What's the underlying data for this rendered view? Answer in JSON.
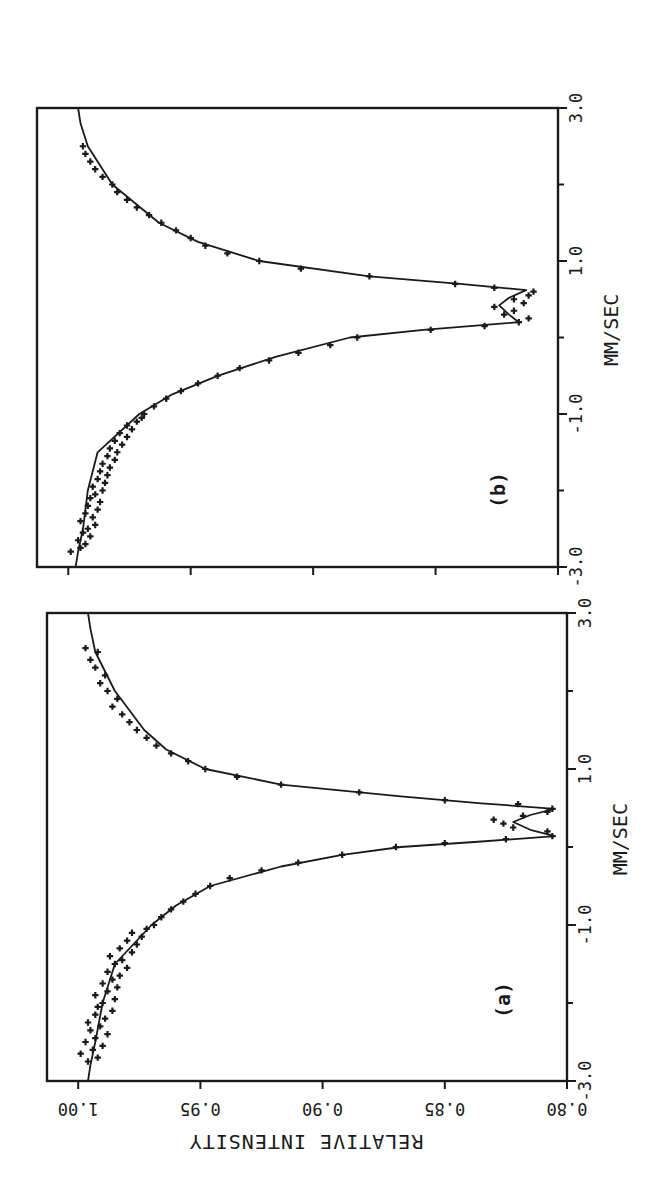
{
  "figure": {
    "background": "#ffffff",
    "ink_color": "#1a1a1a",
    "orientation": "rotated 90 degrees clockwise",
    "shared_ylabel": "RELATIVE INTENSITY"
  },
  "chart_data": [
    {
      "panel": "(a)",
      "type": "scatter",
      "title": "(a)",
      "xlabel": "MM/SEC",
      "ylabel": "RELATIVE INTENSITY",
      "xlim": [
        -3.0,
        3.0
      ],
      "ylim": [
        0.8,
        1.0
      ],
      "x_ticks": [
        -3.0,
        -2.0,
        -1.0,
        0.0,
        1.0,
        2.0,
        3.0
      ],
      "x_tick_labels": [
        "-3.0",
        "",
        "-1.0",
        "",
        "1.0",
        "",
        "3.0"
      ],
      "y_ticks": [
        0.8,
        0.85,
        0.9,
        0.95,
        1.0
      ],
      "y_tick_labels": [
        "0.80",
        "0.85",
        "0.90",
        "0.95",
        "1.00"
      ],
      "grid": false,
      "legend": null,
      "annotations": [
        "quadrupole doublet, minima near 0.14 and 0.49 mm/s"
      ],
      "series": [
        {
          "name": "fit",
          "style": "line",
          "x": [
            -3.0,
            -2.8,
            -2.5,
            -2.0,
            -1.5,
            -1.0,
            -0.75,
            -0.5,
            -0.25,
            -0.1,
            0.0,
            0.07,
            0.14,
            0.22,
            0.32,
            0.41,
            0.49,
            0.56,
            0.65,
            0.8,
            1.0,
            1.25,
            1.5,
            2.0,
            2.5,
            2.8,
            3.0
          ],
          "y": [
            0.996,
            0.995,
            0.993,
            0.99,
            0.985,
            0.97,
            0.96,
            0.946,
            0.917,
            0.892,
            0.868,
            0.835,
            0.805,
            0.815,
            0.822,
            0.815,
            0.805,
            0.835,
            0.868,
            0.917,
            0.948,
            0.964,
            0.973,
            0.985,
            0.993,
            0.995,
            0.996
          ]
        },
        {
          "name": "data",
          "style": "plus-markers",
          "x": [
            -2.75,
            -2.7,
            -2.65,
            -2.6,
            -2.55,
            -2.5,
            -2.45,
            -2.4,
            -2.35,
            -2.3,
            -2.25,
            -2.2,
            -2.15,
            -2.1,
            -2.05,
            -2.0,
            -1.95,
            -1.9,
            -1.85,
            -1.8,
            -1.75,
            -1.7,
            -1.65,
            -1.6,
            -1.55,
            -1.5,
            -1.45,
            -1.4,
            -1.35,
            -1.3,
            -1.25,
            -1.2,
            -1.15,
            -1.1,
            -1.05,
            -1.0,
            -0.9,
            -0.8,
            -0.7,
            -0.6,
            -0.5,
            -0.4,
            -0.3,
            -0.2,
            -0.1,
            0.0,
            0.05,
            0.1,
            0.14,
            0.2,
            0.25,
            0.3,
            0.35,
            0.4,
            0.45,
            0.49,
            0.55,
            0.6,
            0.7,
            0.8,
            0.9,
            1.0,
            1.1,
            1.2,
            1.3,
            1.4,
            1.5,
            1.6,
            1.7,
            1.8,
            1.9,
            2.0,
            2.1,
            2.2,
            2.3,
            2.4,
            2.5,
            2.55
          ],
          "y": [
            0.996,
            0.992,
            0.999,
            0.994,
            0.99,
            0.997,
            0.993,
            0.988,
            0.995,
            0.991,
            0.996,
            0.989,
            0.993,
            0.986,
            0.992,
            0.99,
            0.985,
            0.993,
            0.988,
            0.984,
            0.99,
            0.986,
            0.983,
            0.988,
            0.98,
            0.985,
            0.982,
            0.987,
            0.978,
            0.983,
            0.976,
            0.98,
            0.974,
            0.978,
            0.972,
            0.969,
            0.966,
            0.962,
            0.957,
            0.952,
            0.946,
            0.938,
            0.925,
            0.91,
            0.892,
            0.87,
            0.85,
            0.825,
            0.806,
            0.808,
            0.822,
            0.826,
            0.83,
            0.818,
            0.808,
            0.806,
            0.82,
            0.85,
            0.885,
            0.917,
            0.935,
            0.948,
            0.955,
            0.962,
            0.968,
            0.972,
            0.976,
            0.979,
            0.982,
            0.986,
            0.984,
            0.988,
            0.991,
            0.989,
            0.993,
            0.995,
            0.992,
            0.997
          ]
        }
      ]
    },
    {
      "panel": "(b)",
      "type": "scatter",
      "title": "(b)",
      "xlabel": "MM/SEC",
      "ylabel": "RELATIVE INTENSITY",
      "xlim": [
        -3.0,
        3.0
      ],
      "ylim": [
        0.8,
        1.0
      ],
      "x_ticks": [
        -3.0,
        -2.0,
        -1.0,
        0.0,
        1.0,
        2.0,
        3.0
      ],
      "x_tick_labels": [
        "-3.0",
        "",
        "-1.0",
        "",
        "1.0",
        "",
        "3.0"
      ],
      "y_ticks": [
        0.8,
        0.85,
        0.9,
        0.95,
        1.0
      ],
      "y_tick_labels": [
        "",
        "",
        "",
        "",
        ""
      ],
      "grid": false,
      "legend": null,
      "annotations": [
        "broadened doublet, minima near 0.2 and 0.62 mm/s"
      ],
      "series": [
        {
          "name": "fit",
          "style": "line",
          "x": [
            -3.0,
            -2.8,
            -2.5,
            -2.0,
            -1.5,
            -1.0,
            -0.75,
            -0.5,
            -0.25,
            0.0,
            0.1,
            0.2,
            0.3,
            0.42,
            0.52,
            0.62,
            0.7,
            0.8,
            1.0,
            1.25,
            1.5,
            2.0,
            2.5,
            2.8,
            3.0
          ],
          "y": [
            0.997,
            0.996,
            0.994,
            0.992,
            0.988,
            0.971,
            0.958,
            0.939,
            0.915,
            0.885,
            0.855,
            0.816,
            0.82,
            0.824,
            0.82,
            0.813,
            0.84,
            0.877,
            0.922,
            0.947,
            0.963,
            0.982,
            0.992,
            0.995,
            0.996
          ]
        },
        {
          "name": "data",
          "style": "plus-markers",
          "x": [
            -2.8,
            -2.75,
            -2.7,
            -2.65,
            -2.6,
            -2.55,
            -2.5,
            -2.45,
            -2.4,
            -2.35,
            -2.3,
            -2.25,
            -2.2,
            -2.15,
            -2.1,
            -2.05,
            -2.0,
            -1.95,
            -1.9,
            -1.85,
            -1.8,
            -1.75,
            -1.7,
            -1.65,
            -1.6,
            -1.55,
            -1.5,
            -1.45,
            -1.4,
            -1.35,
            -1.3,
            -1.25,
            -1.2,
            -1.15,
            -1.1,
            -1.05,
            -1.0,
            -0.9,
            -0.8,
            -0.7,
            -0.6,
            -0.5,
            -0.4,
            -0.3,
            -0.2,
            -0.1,
            0.0,
            0.1,
            0.15,
            0.2,
            0.25,
            0.3,
            0.35,
            0.4,
            0.45,
            0.5,
            0.55,
            0.6,
            0.65,
            0.7,
            0.8,
            0.9,
            1.0,
            1.1,
            1.2,
            1.3,
            1.4,
            1.5,
            1.6,
            1.7,
            1.8,
            1.9,
            2.0,
            2.1,
            2.2,
            2.3,
            2.4,
            2.5
          ],
          "y": [
            0.999,
            0.995,
            0.993,
            0.996,
            0.991,
            0.994,
            0.992,
            0.989,
            0.995,
            0.99,
            0.993,
            0.988,
            0.992,
            0.987,
            0.991,
            0.989,
            0.986,
            0.99,
            0.985,
            0.988,
            0.984,
            0.987,
            0.983,
            0.986,
            0.981,
            0.984,
            0.98,
            0.983,
            0.978,
            0.981,
            0.976,
            0.979,
            0.974,
            0.976,
            0.972,
            0.97,
            0.969,
            0.965,
            0.96,
            0.954,
            0.947,
            0.939,
            0.93,
            0.918,
            0.906,
            0.893,
            0.882,
            0.852,
            0.83,
            0.816,
            0.812,
            0.822,
            0.818,
            0.826,
            0.814,
            0.818,
            0.812,
            0.81,
            0.826,
            0.842,
            0.877,
            0.905,
            0.922,
            0.935,
            0.944,
            0.95,
            0.956,
            0.962,
            0.967,
            0.972,
            0.976,
            0.98,
            0.982,
            0.986,
            0.989,
            0.991,
            0.993,
            0.994
          ]
        }
      ]
    }
  ],
  "layout": {
    "panels": [
      {
        "key": "a",
        "left": 47,
        "top": 613,
        "right": 567,
        "bottom": 1081,
        "label_x": 510,
        "label_y": 1000
      },
      {
        "key": "b",
        "left": 37,
        "top": 108,
        "right": 558,
        "bottom": 567,
        "label_x": 505,
        "label_y": 490
      }
    ]
  }
}
